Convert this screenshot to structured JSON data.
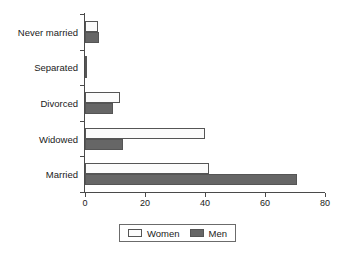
{
  "chart_data": {
    "type": "bar",
    "orientation": "horizontal",
    "title": "",
    "xlabel": "",
    "ylabel": "",
    "categories": [
      "Never married",
      "Separated",
      "Divorced",
      "Widowed",
      "Married"
    ],
    "series": [
      {
        "name": "Women",
        "color": "#fbfbfb",
        "values": [
          4.2,
          0.7,
          11.5,
          40.0,
          41.3
        ]
      },
      {
        "name": "Men",
        "color": "#666666",
        "values": [
          4.5,
          0.8,
          9.3,
          12.5,
          70.7
        ]
      }
    ],
    "xlim": [
      0,
      80
    ],
    "xticks": [
      0,
      20,
      40,
      60,
      80
    ],
    "xtick_labels": [
      "0",
      "20",
      "40",
      "60",
      "80"
    ],
    "grid": false,
    "legend_position": "bottom",
    "legend_entries": [
      "Women",
      "Men"
    ]
  },
  "legend": {
    "women_label": "Women",
    "men_label": "Men"
  }
}
